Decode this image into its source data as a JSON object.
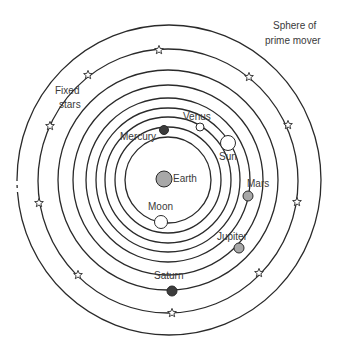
{
  "diagram": {
    "center": {
      "x": 168,
      "y": 180
    },
    "colors": {
      "line": "#2a2a2a",
      "text": "#3a3a3a",
      "grey_body": "#a8a8a8",
      "dark_body": "#3c3c3c",
      "white_body": "#ffffff"
    },
    "rings": [
      {
        "name": "moon",
        "r": 43
      },
      {
        "name": "mercury",
        "r": 53
      },
      {
        "name": "venus",
        "r": 63
      },
      {
        "name": "sun",
        "r": 72
      },
      {
        "name": "mars",
        "r": 82
      },
      {
        "name": "jupiter",
        "r": 95
      },
      {
        "name": "saturn",
        "r": 110
      },
      {
        "name": "fixed-stars",
        "r": 131
      },
      {
        "name": "prime-mover",
        "r": 153
      }
    ],
    "bodies": [
      {
        "name": "Earth",
        "label": "Earth",
        "x": 164,
        "y": 179,
        "r": 8,
        "fill": "grey"
      },
      {
        "name": "Moon",
        "label": "Moon",
        "x": 161,
        "y": 222,
        "r": 6.5,
        "fill": "white"
      },
      {
        "name": "Mercury",
        "label": "Mercury",
        "x": 164,
        "y": 130,
        "r": 4.5,
        "fill": "dark"
      },
      {
        "name": "Venus",
        "label": "Venus",
        "x": 200,
        "y": 127,
        "r": 4,
        "fill": "white"
      },
      {
        "name": "Sun",
        "label": "Sun",
        "x": 228,
        "y": 143,
        "r": 7.5,
        "fill": "white"
      },
      {
        "name": "Mars",
        "label": "Mars",
        "x": 248,
        "y": 196,
        "r": 5,
        "fill": "grey"
      },
      {
        "name": "Jupiter",
        "label": "Jupiter",
        "x": 239,
        "y": 248,
        "r": 5,
        "fill": "grey"
      },
      {
        "name": "Saturn",
        "label": "Saturn",
        "x": 172,
        "y": 291,
        "r": 5,
        "fill": "dark"
      }
    ],
    "labels": {
      "earth": "Earth",
      "moon": "Moon",
      "mercury": "Mercury",
      "venus": "Venus",
      "sun": "Sun",
      "mars": "Mars",
      "jupiter": "Jupiter",
      "saturn": "Saturn",
      "fixed_stars_line1": "Fixed",
      "fixed_stars_line2": "stars",
      "prime_mover_line1": "Sphere of",
      "prime_mover_line2": "prime mover"
    },
    "stars": [
      {
        "x": 159,
        "y": 50
      },
      {
        "x": 88,
        "y": 75
      },
      {
        "x": 50,
        "y": 126
      },
      {
        "x": 39,
        "y": 203
      },
      {
        "x": 78,
        "y": 275
      },
      {
        "x": 172,
        "y": 313
      },
      {
        "x": 259,
        "y": 273
      },
      {
        "x": 297,
        "y": 202
      },
      {
        "x": 288,
        "y": 125
      },
      {
        "x": 249,
        "y": 77
      }
    ]
  }
}
